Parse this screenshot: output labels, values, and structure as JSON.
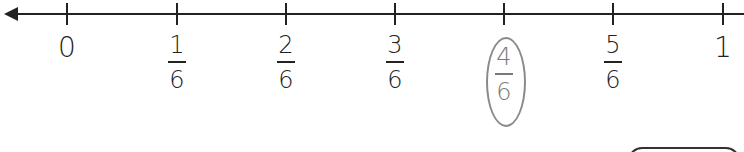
{
  "number_line": {
    "ticks": [
      {
        "label": "0",
        "type": "whole",
        "x": 67
      },
      {
        "numerator": "1",
        "denominator": "6",
        "type": "fraction",
        "x": 177
      },
      {
        "numerator": "2",
        "denominator": "6",
        "type": "fraction",
        "x": 286
      },
      {
        "numerator": "3",
        "denominator": "6",
        "type": "fraction",
        "x": 395
      },
      {
        "numerator": "4",
        "denominator": "6",
        "type": "fraction",
        "x": 504,
        "circled": true
      },
      {
        "numerator": "5",
        "denominator": "6",
        "type": "fraction",
        "x": 613
      },
      {
        "label": "1",
        "type": "whole",
        "x": 723
      }
    ],
    "highlighted": "4/6",
    "colors": {
      "line": "#222222",
      "highlight": "#7a7a7a"
    }
  }
}
